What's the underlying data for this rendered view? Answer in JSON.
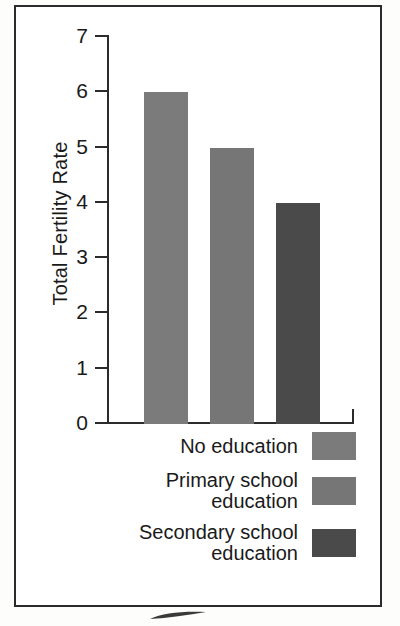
{
  "chart_data": {
    "type": "bar",
    "title": "",
    "xlabel": "",
    "ylabel": "Total Fertility Rate",
    "ylim": [
      0,
      7
    ],
    "ytick_labels": [
      "7",
      "6",
      "5",
      "4",
      "3",
      "2",
      "1",
      "0"
    ],
    "ytick_values": [
      7,
      6,
      5,
      4,
      3,
      2,
      1,
      0
    ],
    "grid": false,
    "legend_position": "below-axes-right-aligned",
    "categories": [
      "No education",
      "Primary school education",
      "Secondary school education"
    ],
    "values": [
      6,
      5,
      4
    ],
    "series": [
      {
        "name": "Total Fertility Rate",
        "values": [
          6,
          5,
          4
        ]
      }
    ],
    "bar_colors": [
      "#7b7b7b",
      "#767676",
      "#4a4a4a"
    ]
  },
  "axis": {
    "y_title": "Total Fertility Rate",
    "ticks": [
      {
        "label": "7",
        "value": 7
      },
      {
        "label": "6",
        "value": 6
      },
      {
        "label": "5",
        "value": 5
      },
      {
        "label": "4",
        "value": 4
      },
      {
        "label": "3",
        "value": 3
      },
      {
        "label": "2",
        "value": 2
      },
      {
        "label": "1",
        "value": 1
      },
      {
        "label": "0",
        "value": 0
      }
    ]
  },
  "bars": [
    {
      "label": "No education",
      "value": 6,
      "color": "#7b7b7b"
    },
    {
      "label": "Primary school education",
      "value": 5,
      "color": "#767676"
    },
    {
      "label": "Secondary school education",
      "value": 4,
      "color": "#4a4a4a"
    }
  ],
  "legend": {
    "items": [
      {
        "label": "No education",
        "color": "#7b7b7b"
      },
      {
        "label": "Primary school\neducation",
        "color": "#767676"
      },
      {
        "label": "Secondary school\neducation",
        "color": "#4a4a4a"
      }
    ]
  }
}
